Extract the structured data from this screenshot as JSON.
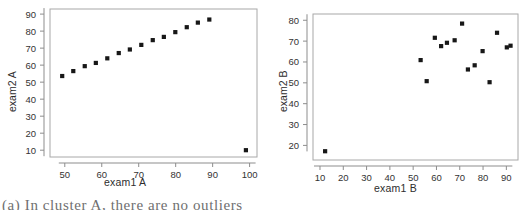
{
  "figure": {
    "caption_partial": "(a) In cluster A, there are no outliers",
    "background_color": "#ffffff",
    "marker_color": "#171717",
    "axis_color": "#8d8d8d"
  },
  "panels": [
    {
      "id": "a",
      "xlabel": "exam1 A",
      "ylabel": "exam2 A"
    },
    {
      "id": "b",
      "xlabel": "exam1 B",
      "ylabel": "exam2 B"
    }
  ],
  "chart_data": [
    {
      "type": "scatter",
      "title": "",
      "xlabel": "exam1 A",
      "ylabel": "exam2 A",
      "xlim": [
        46,
        102
      ],
      "ylim": [
        6,
        93
      ],
      "xticks": [
        50,
        60,
        70,
        80,
        90,
        100
      ],
      "yticks": [
        10,
        20,
        30,
        40,
        50,
        60,
        70,
        80,
        90
      ],
      "grid": false,
      "legend": "none",
      "points": [
        {
          "x": 49.3,
          "y": 53.6
        },
        {
          "x": 52.3,
          "y": 56.5
        },
        {
          "x": 55.4,
          "y": 59.4
        },
        {
          "x": 58.4,
          "y": 61.3
        },
        {
          "x": 61.5,
          "y": 64.0
        },
        {
          "x": 64.6,
          "y": 67.1
        },
        {
          "x": 67.6,
          "y": 69.2
        },
        {
          "x": 70.7,
          "y": 71.9
        },
        {
          "x": 73.8,
          "y": 74.7
        },
        {
          "x": 76.8,
          "y": 76.6
        },
        {
          "x": 79.9,
          "y": 79.4
        },
        {
          "x": 83.0,
          "y": 82.3
        },
        {
          "x": 86.0,
          "y": 85.0
        },
        {
          "x": 89.1,
          "y": 86.8
        },
        {
          "x": 99.0,
          "y": 10.0
        }
      ]
    },
    {
      "type": "scatter",
      "title": "",
      "xlabel": "exam1 B",
      "ylabel": "exam2 B",
      "xlim": [
        7,
        95
      ],
      "ylim": [
        13,
        83
      ],
      "xticks": [
        10,
        20,
        30,
        40,
        50,
        60,
        70,
        80,
        90
      ],
      "yticks": [
        20,
        30,
        40,
        50,
        60,
        70,
        80
      ],
      "grid": false,
      "legend": "none",
      "points": [
        {
          "x": 12.2,
          "y": 17.2
        },
        {
          "x": 53.2,
          "y": 60.9
        },
        {
          "x": 55.8,
          "y": 50.8
        },
        {
          "x": 59.3,
          "y": 71.6
        },
        {
          "x": 62.0,
          "y": 67.6
        },
        {
          "x": 64.5,
          "y": 69.2
        },
        {
          "x": 67.8,
          "y": 70.4
        },
        {
          "x": 71.0,
          "y": 78.4
        },
        {
          "x": 73.5,
          "y": 56.4
        },
        {
          "x": 76.4,
          "y": 58.4
        },
        {
          "x": 79.8,
          "y": 65.2
        },
        {
          "x": 82.8,
          "y": 50.3
        },
        {
          "x": 86.0,
          "y": 74.0
        },
        {
          "x": 90.2,
          "y": 67.0
        },
        {
          "x": 91.8,
          "y": 67.8
        }
      ]
    }
  ]
}
